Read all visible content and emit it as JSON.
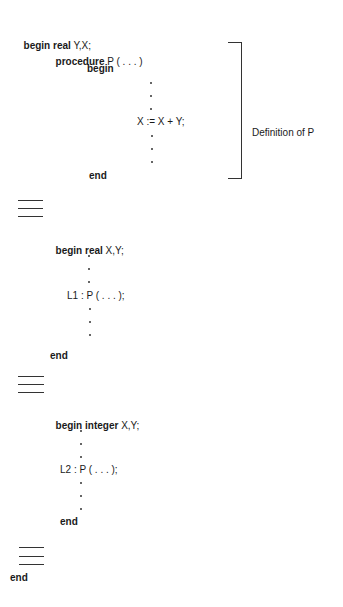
{
  "program": {
    "outer_begin": {
      "kw": "begin real",
      "vars": " Y,X;"
    },
    "procedure_decl": {
      "kw": "procedure",
      "rest": " P ( . . . )"
    },
    "proc_begin": "begin",
    "proc_statement": "X := X + Y;",
    "proc_end": "end",
    "block1_begin": {
      "kw": "begin real",
      "vars": " X,Y;"
    },
    "block1_call": "L1 : P ( . . . );",
    "block1_end": "end",
    "block2_begin": {
      "kw": "begin integer",
      "vars": " X,Y;"
    },
    "block2_call": "L2 : P ( . . . );",
    "block2_end": "end",
    "outer_end": "end"
  },
  "annotation": {
    "bracket_label": "Definition of P"
  }
}
